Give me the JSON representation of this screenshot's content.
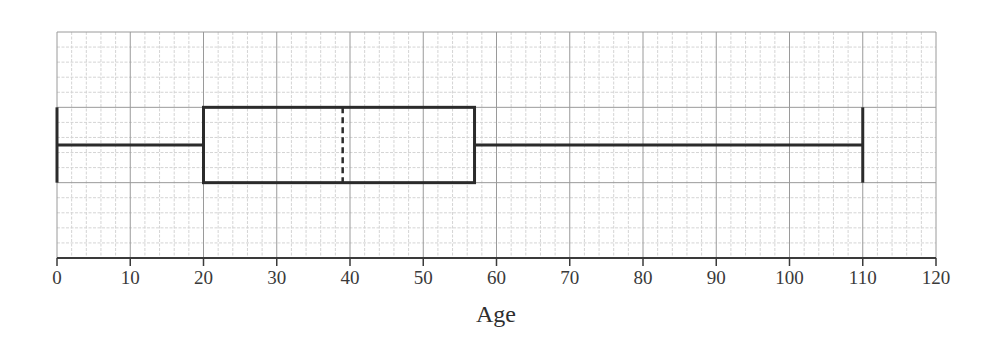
{
  "chart_data": {
    "type": "boxplot",
    "title": "",
    "xlabel": "Age",
    "ylabel": "",
    "xlim": [
      0,
      120
    ],
    "x_ticks": [
      0,
      10,
      20,
      30,
      40,
      50,
      60,
      70,
      80,
      90,
      100,
      110,
      120
    ],
    "x_tick_labels": [
      "0",
      "10",
      "20",
      "30",
      "40",
      "50",
      "60",
      "70",
      "80",
      "90",
      "100",
      "110",
      "120"
    ],
    "minor_step": 2,
    "grid": true,
    "orientation": "horizontal",
    "series": [
      {
        "name": "Age",
        "min": 0,
        "q1": 20,
        "median": 39,
        "q3": 57,
        "max": 110,
        "median_style": "dashed"
      }
    ],
    "colors": {
      "box_stroke": "#2b2b2b",
      "major_grid": "#9a9a9a",
      "minor_grid": "#d4d4d4",
      "axis": "#3a3a3a"
    }
  }
}
